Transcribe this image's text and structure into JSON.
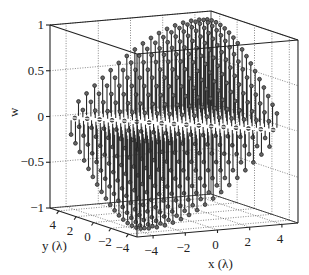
{
  "chart_data": {
    "type": "stem3",
    "title": "",
    "xlabel": "x (λ)",
    "ylabel": "y (λ)",
    "zlabel": "w",
    "xlim": [
      -5,
      5
    ],
    "ylim": [
      -5,
      5
    ],
    "zlim": [
      -1,
      1
    ],
    "x_ticks": [
      -4,
      -2,
      0,
      2,
      4
    ],
    "y_ticks": [
      -4,
      -2,
      0,
      2,
      4
    ],
    "z_ticks": [
      -1,
      -0.5,
      0,
      0.5,
      1
    ],
    "x_tick_labels": [
      "−4",
      "−2",
      "0",
      "2",
      "4"
    ],
    "y_tick_labels": [
      "−4",
      "−2",
      "0",
      "2",
      "4"
    ],
    "z_tick_labels": [
      "−1",
      "−0.5",
      "0",
      "0.5",
      "1"
    ],
    "grid": true,
    "surface_description": "Stem plot of w over a diamond-shaped region; w rises to ~0.95 near (x,y)=(4,4) and falls to ~-0.95 near (-4,-4); zero crossing along x+y=0",
    "model": {
      "function": "w = sin(pi*(x+y)/16) within |x-y|<=8",
      "sample_step": 0.5,
      "amplitude": 0.95
    },
    "sample_points": [
      {
        "x": 4,
        "y": 4,
        "w": 0.95
      },
      {
        "x": 2,
        "y": 2,
        "w": 0.71
      },
      {
        "x": 0,
        "y": 0,
        "w": 0
      },
      {
        "x": -2,
        "y": -2,
        "w": -0.71
      },
      {
        "x": -4,
        "y": -4,
        "w": -0.95
      },
      {
        "x": 4,
        "y": -4,
        "w": 0
      },
      {
        "x": -4,
        "y": 4,
        "w": 0
      }
    ]
  },
  "colors": {
    "stem": "#2a2a2a",
    "box": "#222222",
    "grid": "#555555",
    "background": "#ffffff"
  }
}
